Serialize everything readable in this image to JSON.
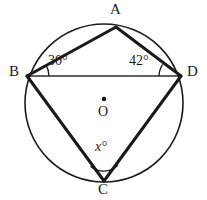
{
  "figure": {
    "type": "circle-geometry-diagram",
    "colors": {
      "stroke": "#1a1a1a",
      "background": "#ffffff",
      "thin_stroke": "#2b2b2b"
    },
    "circle": {
      "center_label": "O",
      "cx": 104,
      "cy": 103,
      "r": 79,
      "stroke_width": 1.6
    },
    "center_point": {
      "label": "O",
      "dot_radius": 2.2,
      "x": 104,
      "y": 99
    },
    "vertices": [
      {
        "id": "A",
        "label": "A",
        "x": 116,
        "y": 27
      },
      {
        "id": "B",
        "label": "B",
        "x": 27,
        "y": 76
      },
      {
        "id": "C",
        "label": "C",
        "x": 104,
        "y": 181
      },
      {
        "id": "D",
        "label": "D",
        "x": 181,
        "y": 76
      }
    ],
    "chords": [
      {
        "id": "AB",
        "from": "B",
        "to": "A",
        "stroke_width": 3.0
      },
      {
        "id": "AD",
        "from": "A",
        "to": "D",
        "stroke_width": 3.0
      },
      {
        "id": "BC",
        "from": "B",
        "to": "C",
        "stroke_width": 3.0
      },
      {
        "id": "CD",
        "from": "C",
        "to": "D",
        "stroke_width": 3.0
      },
      {
        "id": "BD",
        "from": "B",
        "to": "D",
        "stroke_width": 1.6
      }
    ],
    "angles": [
      {
        "id": "angle-ABD",
        "at_vertex": "B",
        "label": "30°",
        "value": 30,
        "unit": "degrees",
        "arc_radius": 22
      },
      {
        "id": "angle-ADB",
        "at_vertex": "D",
        "label": "42°",
        "value": 42,
        "unit": "degrees",
        "arc_radius": 22
      },
      {
        "id": "angle-BCD",
        "at_vertex": "C",
        "label": "x°",
        "variable": "x",
        "degree_symbol": "°",
        "unit": "degrees",
        "arc_radius": 20
      }
    ]
  }
}
